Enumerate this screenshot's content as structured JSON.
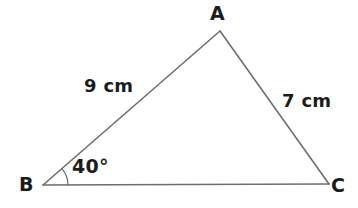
{
  "figure": {
    "type": "triangle-diagram",
    "background_color": "#ffffff",
    "stroke_color": "#6e6e6e",
    "text_color": "#1c1c1c",
    "stroke_width": 1.6,
    "vertices": {
      "A": {
        "label": "A",
        "x": 220,
        "y": 31
      },
      "B": {
        "label": "B",
        "x": 43,
        "y": 185
      },
      "C": {
        "label": "C",
        "x": 329,
        "y": 184
      }
    },
    "sides": [
      {
        "name": "AB",
        "label": "9 cm",
        "value": 9,
        "unit": "cm",
        "from": "B",
        "to": "A"
      },
      {
        "name": "AC",
        "label": "7 cm",
        "value": 7,
        "unit": "cm",
        "from": "A",
        "to": "C"
      },
      {
        "name": "BC",
        "label": "",
        "value": null,
        "unit": "",
        "from": "B",
        "to": "C"
      }
    ],
    "angles": [
      {
        "at": "B",
        "label": "40°",
        "value": 40,
        "unit": "degrees",
        "arc_radius": 25
      }
    ]
  }
}
